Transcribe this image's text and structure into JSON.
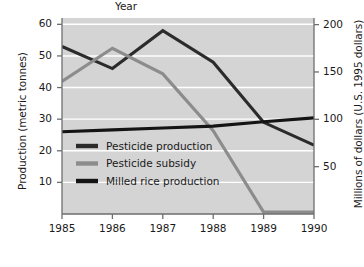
{
  "chart_data": {
    "type": "line",
    "title": "",
    "xlabel": "Year",
    "ylabel": "Production (metric tonnes)",
    "ylabel_right": "Millions of dollars (U.S. 1995 dollars)",
    "x": [
      1985,
      1986,
      1987,
      1988,
      1989,
      1990
    ],
    "xticklabels": [
      "1985",
      "1986",
      "1987",
      "1988",
      "1989",
      "1990"
    ],
    "xlim": [
      1985,
      1990
    ],
    "ylim": [
      0,
      62
    ],
    "yticks": [
      10,
      20,
      30,
      40,
      50,
      60
    ],
    "yticklabels": [
      "10",
      "20",
      "30",
      "40",
      "50",
      "60"
    ],
    "ylim_right": [
      0,
      207
    ],
    "yticks_right": [
      50,
      100,
      150,
      200
    ],
    "yticklabels_right": [
      "50",
      "100",
      "150",
      "200"
    ],
    "grid": true,
    "grid_color": "#ffffff",
    "plot_background": "#d4d4d4",
    "legend_position": "lower left",
    "series": [
      {
        "name": "Pesticide production",
        "axis": "left",
        "color": "#2b2b2b",
        "values": [
          53.0,
          46.0,
          58.0,
          48.0,
          29.0,
          21.8
        ]
      },
      {
        "name": "Pesticide subsidy",
        "axis": "right",
        "color": "#8c8c8c",
        "values": [
          140.0,
          175.0,
          148.0,
          88.0,
          2.0,
          2.0
        ]
      },
      {
        "name": "Milled rice production",
        "axis": "left",
        "color": "#141414",
        "values": [
          26.0,
          26.6,
          27.2,
          27.8,
          29.2,
          30.4
        ]
      }
    ]
  },
  "legend": {
    "items": [
      {
        "label": "Pesticide production",
        "color": "#2b2b2b"
      },
      {
        "label": "Pesticide subsidy",
        "color": "#8c8c8c"
      },
      {
        "label": "Milled rice production",
        "color": "#141414"
      }
    ]
  }
}
